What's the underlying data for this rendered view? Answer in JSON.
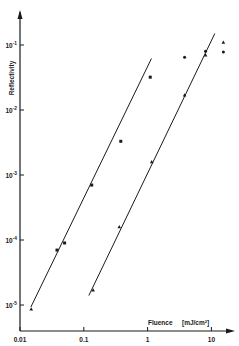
{
  "chart_data": {
    "type": "scatter",
    "title": "",
    "xlabel": "Fluence",
    "xunit": "[mJ/cm²]",
    "ylabel": "Reflectivity",
    "xscale": "log",
    "yscale": "log",
    "xlim": [
      0.01,
      30
    ],
    "ylim": [
      5e-06,
      0.2
    ],
    "grid": false,
    "x_ticks": [
      {
        "value": 0.01,
        "label": "0.01"
      },
      {
        "value": 0.1,
        "label": "0.1"
      },
      {
        "value": 1,
        "label": "1"
      },
      {
        "value": 10,
        "label": "10"
      }
    ],
    "y_ticks": [
      {
        "value": 0.1,
        "base": "10",
        "exp": "-1"
      },
      {
        "value": 0.01,
        "base": "10",
        "exp": "-2"
      },
      {
        "value": 0.001,
        "base": "10",
        "exp": "-3"
      },
      {
        "value": 0.0001,
        "base": "10",
        "exp": "-4"
      },
      {
        "value": 1e-05,
        "base": "10",
        "exp": "-5"
      }
    ],
    "series": [
      {
        "name": "series-1 (squares)",
        "marker": "square",
        "points": [
          {
            "x": 0.015,
            "y": 8.7e-06,
            "marker": "triangle"
          },
          {
            "x": 0.038,
            "y": 7e-05
          },
          {
            "x": 0.05,
            "y": 9e-05
          },
          {
            "x": 0.133,
            "y": 0.0007
          },
          {
            "x": 0.38,
            "y": 0.0033
          },
          {
            "x": 1.1,
            "y": 0.032
          }
        ],
        "fit_line": {
          "x0": 0.0148,
          "y0": 9.3e-06,
          "x1": 1.15,
          "y1": 0.062
        }
      },
      {
        "name": "series-2 (triangles)",
        "marker": "triangle",
        "points": [
          {
            "x": 0.14,
            "y": 1.7e-05
          },
          {
            "x": 0.36,
            "y": 0.00016
          },
          {
            "x": 1.16,
            "y": 0.0016
          },
          {
            "x": 3.8,
            "y": 0.017
          },
          {
            "x": 8.1,
            "y": 0.07
          },
          {
            "x": 15.4,
            "y": 0.11
          }
        ],
        "fit_line": {
          "x0": 0.12,
          "y0": 1.4e-05,
          "x1": 11.3,
          "y1": 0.15
        }
      },
      {
        "name": "series-3 (dots, saturation)",
        "marker": "dot",
        "points": [
          {
            "x": 3.8,
            "y": 0.065
          },
          {
            "x": 8.1,
            "y": 0.08
          },
          {
            "x": 15.4,
            "y": 0.078
          }
        ]
      }
    ],
    "legend": null
  }
}
